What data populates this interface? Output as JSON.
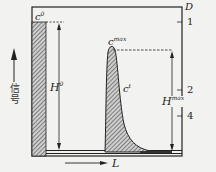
{
  "diagram": {
    "type": "chromatogram-schematic",
    "y_axis_label": "信号",
    "x_axis_label": "L",
    "right_axis_label": "D",
    "right_ticks": [
      "1",
      "2",
      "4"
    ],
    "labels": {
      "c0": {
        "base": "c",
        "sup": "0"
      },
      "cmax": {
        "base": "c",
        "sup": "max"
      },
      "ct": {
        "base": "c",
        "sup": "t"
      },
      "H0": {
        "base": "H",
        "sup": "0"
      },
      "Hmax": {
        "base": "H",
        "sup": "max"
      }
    },
    "colors": {
      "line": "#222222",
      "background": "#f2f2f0",
      "hatch": "#555555"
    }
  }
}
